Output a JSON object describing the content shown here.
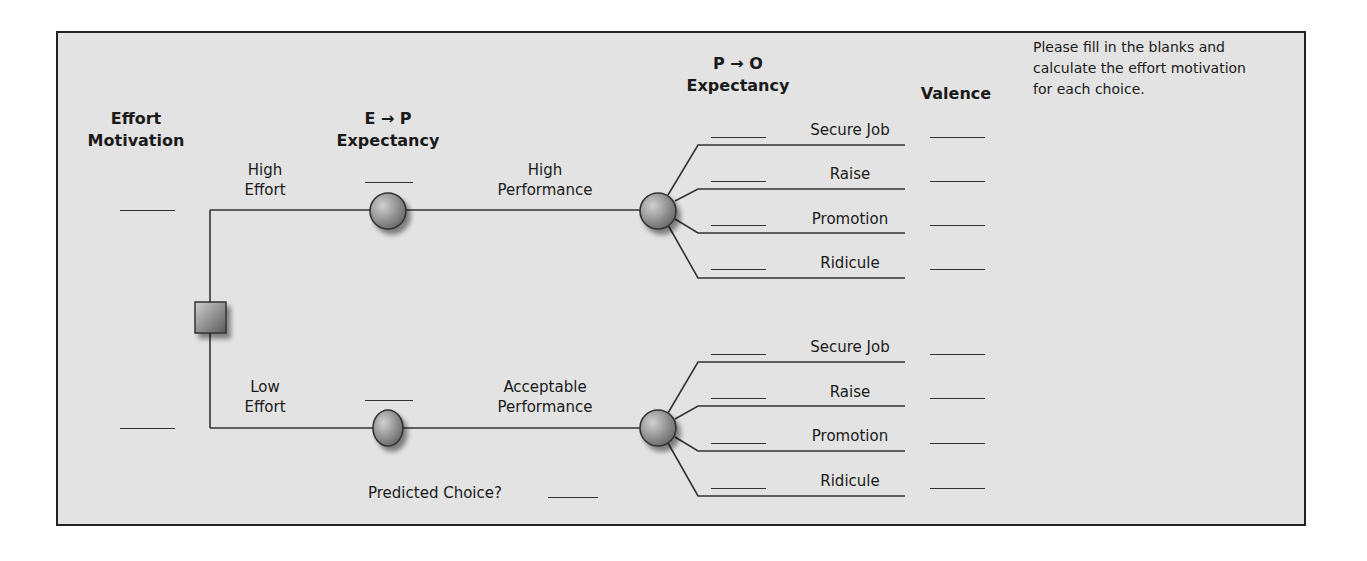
{
  "headers": {
    "effort_motivation": [
      "Effort",
      "Motivation"
    ],
    "ep_expectancy": [
      "E → P",
      "Expectancy"
    ],
    "po_expectancy": [
      "P → O",
      "Expectancy"
    ],
    "valence": "Valence"
  },
  "instructions": "Please fill in the blanks and calculate the effort motivation for each choice.",
  "branches": [
    {
      "effort_label": [
        "High",
        "Effort"
      ],
      "performance_label": [
        "High",
        "Performance"
      ],
      "outcomes": [
        "Secure Job",
        "Raise",
        "Promotion",
        "Ridicule"
      ]
    },
    {
      "effort_label": [
        "Low",
        "Effort"
      ],
      "performance_label": [
        "Acceptable",
        "Performance"
      ],
      "outcomes": [
        "Secure Job",
        "Raise",
        "Promotion",
        "Ridicule"
      ]
    }
  ],
  "predicted_choice_label": "Predicted Choice?",
  "colors": {
    "background": "#e3e3e3",
    "line": "#333333",
    "border": "#222222"
  }
}
